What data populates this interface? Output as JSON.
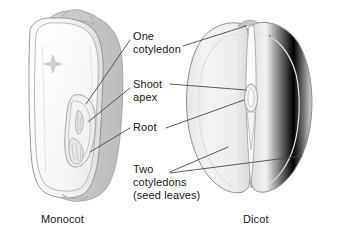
{
  "figure": {
    "background_color": "#ffffff",
    "line_color": "#4a4a4a",
    "text_color": "#1a1a1a"
  },
  "labels": {
    "one_cotyledon": "One\ncotyledon",
    "shoot_apex": "Shoot\napex",
    "root": "Root",
    "two_cotyledons": "Two\ncotyledons\n(seed leaves)"
  },
  "captions": {
    "monocot": "Monocot",
    "dicot": "Dicot"
  },
  "specimens": {
    "monocot": {
      "name": "Monocot",
      "description": "Corn kernel shown in cut-away section with single cotyledon, shoot apex and root visible inside",
      "fill": "#f4f4f4",
      "shade": "#c8c8c8"
    },
    "dicot": {
      "name": "Dicot",
      "description": "Bean seed split open showing two fleshy cotyledons with embryo at the central cleft",
      "fill": "#eeeeee",
      "shade": "#cfcfcf"
    }
  }
}
